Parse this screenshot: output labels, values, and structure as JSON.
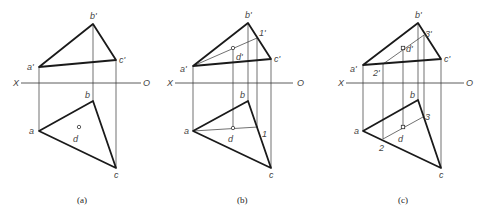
{
  "figure": {
    "panels": [
      {
        "id": "a",
        "caption": "(a)",
        "axis": {
          "left_label": "X",
          "right_label": "O"
        },
        "points": {
          "a_prime": "a'",
          "b_prime": "b'",
          "c_prime": "c'",
          "a": "a",
          "b": "b",
          "c": "c",
          "d": "d"
        }
      },
      {
        "id": "b",
        "caption": "(b)",
        "axis": {
          "left_label": "X",
          "right_label": "O"
        },
        "points": {
          "a_prime": "a'",
          "b_prime": "b'",
          "c_prime": "c'",
          "d_prime": "d'",
          "one_prime": "1'",
          "a": "a",
          "b": "b",
          "c": "c",
          "d": "d",
          "one": "1"
        }
      },
      {
        "id": "c",
        "caption": "(c)",
        "axis": {
          "left_label": "X",
          "right_label": "O"
        },
        "points": {
          "a_prime": "a'",
          "b_prime": "b'",
          "c_prime": "c'",
          "d_prime": "d'",
          "two_prime": "2'",
          "three_prime": "3'",
          "a": "a",
          "b": "b",
          "c": "c",
          "d": "d",
          "two": "2",
          "three": "3"
        }
      }
    ]
  }
}
